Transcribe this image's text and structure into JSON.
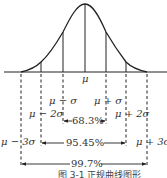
{
  "diagram": {
    "type": "normal-distribution",
    "axis_center_label": "μ",
    "sigma_labels": {
      "minus1": "μ − σ",
      "plus1": "μ + σ",
      "minus2": "μ − 2σ",
      "plus2": "μ + 2σ",
      "minus3": "μ − 3σ",
      "plus3": "μ + 3σ"
    },
    "intervals": [
      {
        "range": "μ ± σ",
        "percent": "68.3%"
      },
      {
        "range": "μ ± 2σ",
        "percent": "95.45%"
      },
      {
        "range": "μ ± 3σ",
        "percent": "99.7%"
      }
    ],
    "caption": "图 3-1  正规曲线图形",
    "colors": {
      "line": "#222222",
      "text": "#333333",
      "background": "#ffffff"
    }
  }
}
